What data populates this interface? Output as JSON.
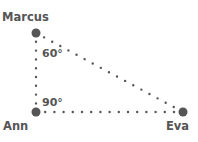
{
  "diagram": {
    "type": "right-triangle",
    "colors": {
      "line": "#555555",
      "point": "#555555",
      "text": "#555555",
      "background": "#ffffff"
    },
    "points": [
      {
        "id": "marcus",
        "label": "Marcus",
        "x": 36,
        "y": 33
      },
      {
        "id": "ann",
        "label": "Ann",
        "x": 36,
        "y": 112
      },
      {
        "id": "eva",
        "label": "Eva",
        "x": 183,
        "y": 112
      }
    ],
    "edges": [
      {
        "from": "marcus",
        "to": "ann",
        "style": "dotted"
      },
      {
        "from": "ann",
        "to": "eva",
        "style": "dotted"
      },
      {
        "from": "marcus",
        "to": "eva",
        "style": "dotted"
      }
    ],
    "angles": [
      {
        "at": "marcus",
        "label": "60°"
      },
      {
        "at": "ann",
        "label": "90°"
      }
    ]
  }
}
